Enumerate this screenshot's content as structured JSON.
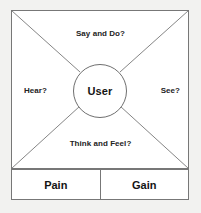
{
  "diagram": {
    "type": "empathy-map",
    "center": {
      "label": "User"
    },
    "quadrants": {
      "top": "Say and Do?",
      "left": "Hear?",
      "right": "See?",
      "bottom": "Think and Feel?"
    },
    "outcomes": [
      {
        "label": "Pain"
      },
      {
        "label": "Gain"
      }
    ],
    "colors": {
      "stroke": "#777777",
      "text": "#141414",
      "background": "#f2f2f0",
      "panel": "#ffffff"
    }
  }
}
